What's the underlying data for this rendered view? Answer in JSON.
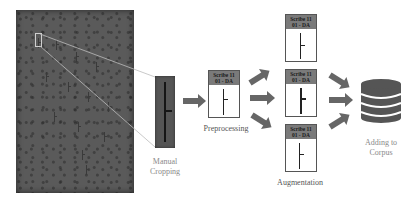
{
  "diagram": {
    "stages": [
      {
        "id": "manual-cropping",
        "label_line1": "Manual",
        "label_line2": "Cropping"
      },
      {
        "id": "preprocessing",
        "label": "Preprocessing"
      },
      {
        "id": "augmentation",
        "label": "Augmentation"
      },
      {
        "id": "adding-to-corpus",
        "label_line1": "Adding to",
        "label_line2": "Corpus"
      }
    ],
    "cards": {
      "preprocessing": {
        "line1": "Scribe 11",
        "line2": "01 - DA"
      },
      "augmentation": [
        {
          "line1": "Scribe 11",
          "line2": "01 - DA"
        },
        {
          "line1": "Scribe 11",
          "line2": "01 - DA"
        },
        {
          "line1": "Scribe 11",
          "line2": "01 - DA"
        }
      ]
    },
    "colors": {
      "manuscript": "#5a5a5a",
      "arrow": "#666666",
      "card_header": "#7a7a7a",
      "database": "#555555",
      "label_gray": "#8a8a8a"
    }
  }
}
